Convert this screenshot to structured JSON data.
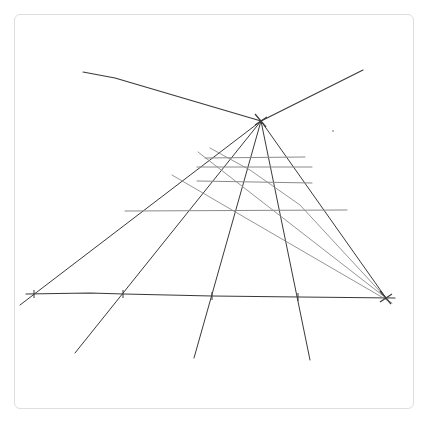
{
  "canvas": {
    "width": 429,
    "height": 424,
    "background": "#ffffff",
    "card": {
      "x": 14,
      "y": 14,
      "w": 400,
      "h": 395,
      "border": "#dedede",
      "radius": 6
    }
  },
  "sketch": {
    "title": "",
    "stroke_color": "#3a3a3a",
    "light_stroke_color": "#8a8a8a",
    "vanishing_points": [
      {
        "id": "vp-top",
        "x": 261,
        "y": 121
      },
      {
        "id": "vp-right",
        "x": 386,
        "y": 298
      }
    ],
    "horizon_lines": [
      {
        "id": "horizon-left",
        "points": [
          [
            83,
            72
          ],
          [
            115,
            78
          ],
          [
            261,
            121
          ]
        ]
      },
      {
        "id": "horizon-right",
        "points": [
          [
            261,
            121
          ],
          [
            363,
            70
          ]
        ]
      }
    ],
    "ground_line": {
      "id": "ground-line",
      "points": [
        [
          26,
          294
        ],
        [
          90,
          293
        ],
        [
          124,
          294
        ],
        [
          212,
          296
        ],
        [
          300,
          297
        ],
        [
          395,
          298
        ]
      ]
    },
    "rays_from_vp_top": [
      {
        "id": "ray-1",
        "points": [
          [
            261,
            121
          ],
          [
            20,
            305
          ]
        ]
      },
      {
        "id": "ray-2",
        "points": [
          [
            261,
            121
          ],
          [
            75,
            353
          ]
        ]
      },
      {
        "id": "ray-3",
        "points": [
          [
            261,
            121
          ],
          [
            194,
            358
          ]
        ]
      },
      {
        "id": "ray-4",
        "points": [
          [
            261,
            121
          ],
          [
            310,
            360
          ]
        ]
      },
      {
        "id": "ray-5",
        "points": [
          [
            261,
            121
          ],
          [
            386,
            298
          ]
        ]
      }
    ],
    "rays_to_vp_right": [
      {
        "id": "diag-1",
        "points": [
          [
            172,
            175
          ],
          [
            232,
            210
          ],
          [
            392,
            303
          ]
        ]
      },
      {
        "id": "diag-2",
        "points": [
          [
            198,
            152
          ],
          [
            386,
            298
          ]
        ]
      },
      {
        "id": "diag-3",
        "points": [
          [
            210,
            148
          ],
          [
            250,
            170
          ],
          [
            300,
            205
          ],
          [
            386,
            298
          ]
        ]
      }
    ],
    "horizontals": [
      {
        "id": "h-1",
        "points": [
          [
            205,
            158
          ],
          [
            305,
            157
          ]
        ]
      },
      {
        "id": "h-2",
        "points": [
          [
            197,
            167
          ],
          [
            312,
            167
          ]
        ]
      },
      {
        "id": "h-3",
        "points": [
          [
            197,
            181
          ],
          [
            312,
            183
          ]
        ]
      },
      {
        "id": "h-4",
        "points": [
          [
            125,
            211
          ],
          [
            347,
            210
          ]
        ]
      }
    ],
    "tick_marks": [
      {
        "id": "tick-1",
        "x": 34,
        "y": 294
      },
      {
        "id": "tick-2",
        "x": 123,
        "y": 294
      },
      {
        "id": "tick-3",
        "x": 212,
        "y": 296
      },
      {
        "id": "tick-4",
        "x": 298,
        "y": 297
      }
    ],
    "cross_marks": [
      {
        "id": "cross-vp-top",
        "x": 261,
        "y": 121
      },
      {
        "id": "cross-vp-right",
        "x": 386,
        "y": 298
      }
    ],
    "stray_dot": {
      "x": 333,
      "y": 131
    }
  }
}
